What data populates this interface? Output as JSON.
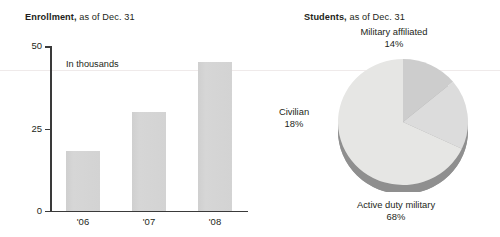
{
  "bar_panel": {
    "title_bold": "Enrollment,",
    "title_rest": " as of Dec. 31",
    "note": "In thousands"
  },
  "pie_panel": {
    "title_bold": "Students,",
    "title_rest": " as of Dec. 31"
  },
  "chart_data": [
    {
      "type": "bar",
      "title": "Enrollment, as of Dec. 31",
      "annotation": "In thousands",
      "xlabel": "",
      "ylabel": "In thousands",
      "categories": [
        "'06",
        "'07",
        "'08"
      ],
      "values": [
        18,
        30,
        45
      ],
      "ylim": [
        0,
        50
      ],
      "yticks": [
        0,
        25,
        50
      ],
      "ytick_labels": [
        "0",
        "25",
        "50"
      ],
      "grid": false,
      "legend": "none",
      "bar_color": "#d2d2d2"
    },
    {
      "type": "pie",
      "title": "Students, as of Dec. 31",
      "labels": [
        "Military affiliated",
        "Civilian",
        "Active duty military"
      ],
      "values": [
        14,
        18,
        68
      ],
      "value_labels": [
        "14%",
        "18%",
        "68%"
      ],
      "slice_colors": [
        "#cdcdcd",
        "#dcdcdc",
        "#e6e6e4"
      ],
      "rim_color": "#8f8f8f",
      "legend": "labels-outside",
      "start_angle_deg": 0
    }
  ]
}
